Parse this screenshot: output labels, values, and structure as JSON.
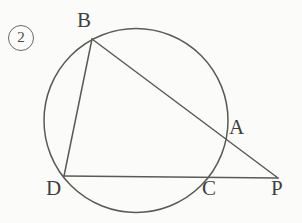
{
  "figure": {
    "item_number": "2",
    "caption": "",
    "background_color": "#fbfbf9",
    "stroke_color": "#5a5a55",
    "label_color": "#3f3f3b",
    "width": 302,
    "height": 223
  },
  "geometry": {
    "circle": {
      "name": "circumscribed-circle",
      "cx": 136,
      "cy": 120.5,
      "r": 92,
      "stroke_width": 1.5
    },
    "points": [
      {
        "id": "B",
        "label": "B",
        "x": 92,
        "y": 39,
        "on_circle": true,
        "label_x": 77,
        "label_y": 10
      },
      {
        "id": "A",
        "label": "A",
        "x": 222,
        "y": 137,
        "on_circle": true,
        "label_x": 229,
        "label_y": 117
      },
      {
        "id": "D",
        "label": "D",
        "x": 64,
        "y": 176,
        "on_circle": true,
        "label_x": 46,
        "label_y": 178
      },
      {
        "id": "C",
        "label": "C",
        "x": 207,
        "y": 177,
        "on_circle": true,
        "label_x": 202,
        "label_y": 178
      },
      {
        "id": "P",
        "label": "P",
        "x": 278,
        "y": 178,
        "on_circle": false,
        "label_x": 271,
        "label_y": 178
      }
    ],
    "segments": [
      {
        "id": "BP",
        "from": "B",
        "to": "P",
        "x1": 92,
        "y1": 39,
        "x2": 278,
        "y2": 178,
        "stroke_width": 1.5
      },
      {
        "id": "BD",
        "from": "B",
        "to": "D",
        "x1": 92,
        "y1": 39,
        "x2": 64,
        "y2": 176,
        "stroke_width": 1.5
      },
      {
        "id": "DP",
        "from": "D",
        "to": "P",
        "x1": 64,
        "y1": 176,
        "x2": 278,
        "y2": 178,
        "stroke_width": 1.5
      }
    ]
  }
}
